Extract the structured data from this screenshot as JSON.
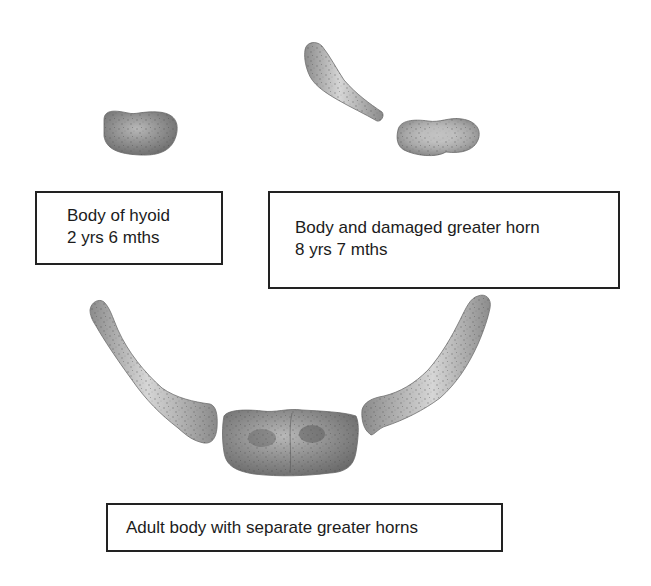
{
  "figure": {
    "background": "#ffffff",
    "bone_color": "#9a9a9a",
    "box_border_color": "#222222",
    "specimens": [
      {
        "id": "young",
        "parts": [
          "body"
        ],
        "label": {
          "line1": "Body of hyoid",
          "line2": "2 yrs 6 mths"
        }
      },
      {
        "id": "child",
        "parts": [
          "greater_horn_damaged",
          "body"
        ],
        "label": {
          "line1": "Body and damaged greater horn",
          "line2": "8 yrs 7 mths"
        }
      },
      {
        "id": "adult",
        "parts": [
          "left_greater_horn",
          "body",
          "right_greater_horn"
        ],
        "label": {
          "line1": "Adult body with separate greater horns"
        }
      }
    ]
  }
}
